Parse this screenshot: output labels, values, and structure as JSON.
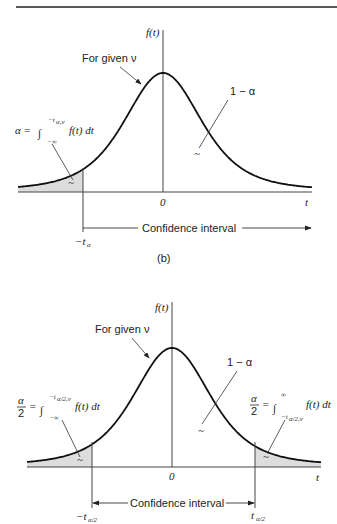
{
  "figure_b": {
    "y_axis_label": "f(t)",
    "x_axis_label": "t",
    "zero_label": "0",
    "curve_label": "For given ν",
    "area_label": "1 − α",
    "left_tail_formula": {
      "lhs": "α =",
      "upper_limit": "−t",
      "upper_limit_sub": "α,ν",
      "lower_limit": "−∞",
      "integrand": "f(t) dt"
    },
    "interval_label": "Confidence interval",
    "cut_label": "−t",
    "cut_label_sub": "α",
    "caption": "(b)"
  },
  "figure_c": {
    "y_axis_label": "f(t)",
    "x_axis_label": "t",
    "zero_label": "0",
    "curve_label": "For given ν",
    "area_label": "1 − α",
    "left_tail_formula": {
      "lhs_num": "α",
      "lhs_den": "2",
      "eq": "=",
      "upper_limit": "−t",
      "upper_limit_sub": "α/2,ν",
      "lower_limit": "−∞",
      "integrand": "f(t) dt"
    },
    "right_tail_formula": {
      "lhs_num": "α",
      "lhs_den": "2",
      "eq": "=",
      "upper_limit": "∞",
      "lower_limit": "−t",
      "lower_limit_sub": "α/2,ν",
      "integrand": "f(t) dt"
    },
    "interval_label": "Confidence interval",
    "left_cut_label": "−t",
    "left_cut_label_sub": "α/2",
    "right_cut_label": "t",
    "right_cut_label_sub": "α/2"
  }
}
